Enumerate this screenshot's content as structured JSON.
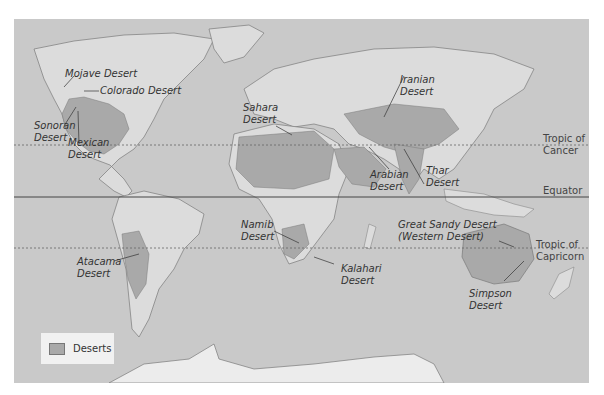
{
  "map": {
    "title": "World Deserts",
    "colors": {
      "ocean": "#c9c9c9",
      "land": "#dcdcdc",
      "desert": "#a9a9a9",
      "antarctica": "#ececec",
      "borders": "#7a7a7a"
    },
    "reference_lines": [
      {
        "name": "Tropic of Cancer",
        "label_line1": "Tropic of",
        "label_line2": "Cancer",
        "style": "dotted"
      },
      {
        "name": "Equator",
        "label_line1": "Equator",
        "style": "solid"
      },
      {
        "name": "Tropic of Capricorn",
        "label_line1": "Tropic of",
        "label_line2": "Capricorn",
        "style": "dotted"
      }
    ],
    "deserts": [
      {
        "line1": "Mojave Desert",
        "line2": ""
      },
      {
        "line1": "Colorado Desert",
        "line2": ""
      },
      {
        "line1": "Sonoran",
        "line2": "Desert"
      },
      {
        "line1": "Mexican",
        "line2": "Desert"
      },
      {
        "line1": "Atacama",
        "line2": "Desert"
      },
      {
        "line1": "Sahara",
        "line2": "Desert"
      },
      {
        "line1": "Namib",
        "line2": "Desert"
      },
      {
        "line1": "Kalahari",
        "line2": "Desert"
      },
      {
        "line1": "Arabian",
        "line2": "Desert"
      },
      {
        "line1": "Iranian",
        "line2": "Desert"
      },
      {
        "line1": "Thar",
        "line2": "Desert"
      },
      {
        "line1": "Great Sandy Desert",
        "line2": "(Western Desert)"
      },
      {
        "line1": "Simpson",
        "line2": "Desert"
      }
    ],
    "legend": {
      "label": "Deserts"
    }
  }
}
